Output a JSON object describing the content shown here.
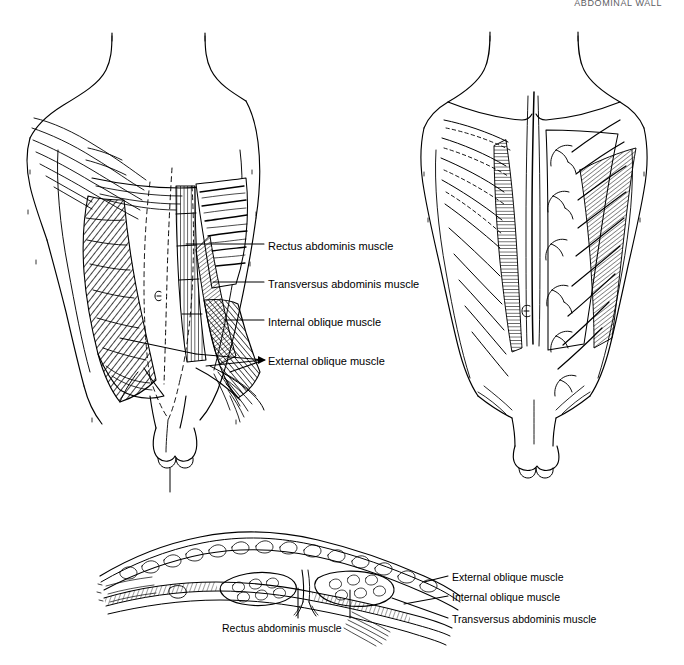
{
  "page": {
    "header_text": "ABDOMINAL WALL",
    "width": 684,
    "height": 665,
    "background": "#ffffff",
    "ink_color": "#000000"
  },
  "figures": {
    "anterior": {
      "name": "Anterior abdominal wall, superficial and deep dissection",
      "view": "anterior",
      "side_note": "left half shows external oblique reflected; right half shows deeper layers and rib cage"
    },
    "posterior": {
      "name": "Abdominal wall, deeper plane with segmental neurovascular branches",
      "view": "anterior-deep",
      "side_note": "right half shows intercostal nerves and vessels"
    },
    "cross_section": {
      "name": "Transverse cross-section of the anterior abdominal wall",
      "view": "transverse",
      "side_note": "shows skin, fat, muscle layers and paired rectus abdominis bellies"
    }
  },
  "labels": {
    "anterior": [
      {
        "text": "Rectus abdominis muscle",
        "y": 240
      },
      {
        "text": "Transversus abdominis muscle",
        "y": 278
      },
      {
        "text": "Internal oblique muscle",
        "y": 316
      },
      {
        "text": "External oblique muscle",
        "y": 356
      }
    ],
    "cross_section_right": [
      {
        "text": "External oblique muscle",
        "y": 572
      },
      {
        "text": "Internal oblique muscle",
        "y": 592
      },
      {
        "text": "Transversus abdominis muscle",
        "y": 614
      }
    ],
    "cross_section_bottom": [
      {
        "text": "Rectus abdominis muscle"
      }
    ]
  },
  "colors": {
    "ink": "#000000",
    "header": "#5d5d63",
    "paper": "#ffffff"
  }
}
